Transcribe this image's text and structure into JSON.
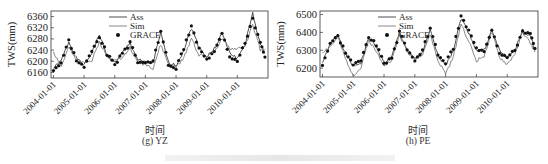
{
  "chart_data": [
    {
      "type": "line",
      "panel_caption": "(g) YZ",
      "xlabel": "时间",
      "ylabel": "TWS(mm)",
      "yticks": [
        6160,
        6200,
        6240,
        6280,
        6320,
        6360
      ],
      "ylim": [
        6140,
        6380
      ],
      "xticks": [
        "2004-01-01",
        "2005-01-01",
        "2006-01-01",
        "2007-01-01",
        "2008-01-01",
        "2009-01-01",
        "2010-01-01"
      ],
      "legend": [
        "Ass",
        "Sim",
        "GRACE"
      ],
      "legend_position": "upper-left-inside",
      "x": [
        2004.0,
        2004.25,
        2004.5,
        2004.75,
        2005.0,
        2005.25,
        2005.5,
        2005.75,
        2006.0,
        2006.25,
        2006.5,
        2006.75,
        2007.0,
        2007.25,
        2007.5,
        2007.75,
        2008.0,
        2008.25,
        2008.5,
        2008.75,
        2009.0,
        2009.25,
        2009.5,
        2009.75,
        2010.0,
        2010.25,
        2010.5,
        2010.75,
        2010.9
      ],
      "series": [
        {
          "name": "Ass",
          "values": [
            6175,
            6200,
            6270,
            6210,
            6185,
            6230,
            6295,
            6220,
            6195,
            6230,
            6265,
            6205,
            6195,
            6195,
            6300,
            6195,
            6185,
            6240,
            6320,
            6250,
            6215,
            6245,
            6300,
            6230,
            6210,
            6260,
            6370,
            6260,
            6230
          ]
        },
        {
          "name": "Sim",
          "values": [
            6235,
            6180,
            6250,
            6200,
            6200,
            6200,
            6270,
            6215,
            6210,
            6210,
            6250,
            6195,
            6190,
            6175,
            6260,
            6190,
            6180,
            6210,
            6285,
            6220,
            6220,
            6235,
            6280,
            6245,
            6245,
            6255,
            6330,
            6240,
            6240
          ]
        },
        {
          "name": "GRACE",
          "values": [
            6170,
            6195,
            6275,
            6205,
            6180,
            6235,
            6290,
            6225,
            6190,
            6225,
            6265,
            6200,
            6195,
            6200,
            6305,
            6190,
            6175,
            6245,
            6325,
            6245,
            6205,
            6240,
            6305,
            6220,
            6200,
            6265,
            6355,
            6265,
            6215
          ]
        }
      ]
    },
    {
      "type": "line",
      "panel_caption": "(h) PE",
      "xlabel": "时间",
      "ylabel": "TWS(mm)",
      "yticks": [
        6200,
        6300,
        6400,
        6500
      ],
      "ylim": [
        6150,
        6520
      ],
      "xticks": [
        "2004-01-01",
        "2005-01-01",
        "2006-01-01",
        "2007-01-01",
        "2008-01-01",
        "2009-01-01",
        "2010-01-01"
      ],
      "legend": [
        "Ass",
        "Sim",
        "GRACE"
      ],
      "legend_position": "upper-left-inside",
      "x": [
        2004.0,
        2004.25,
        2004.5,
        2004.75,
        2005.0,
        2005.25,
        2005.5,
        2005.75,
        2006.0,
        2006.25,
        2006.5,
        2006.75,
        2007.0,
        2007.25,
        2007.5,
        2007.75,
        2008.0,
        2008.25,
        2008.5,
        2008.75,
        2009.0,
        2009.25,
        2009.5,
        2009.75,
        2010.0,
        2010.25,
        2010.5,
        2010.75,
        2010.9
      ],
      "series": [
        {
          "name": "Ass",
          "values": [
            6230,
            6330,
            6390,
            6280,
            6210,
            6230,
            6370,
            6320,
            6230,
            6260,
            6400,
            6300,
            6250,
            6290,
            6410,
            6270,
            6220,
            6300,
            6480,
            6400,
            6300,
            6300,
            6410,
            6300,
            6260,
            6300,
            6410,
            6380,
            6300
          ]
        },
        {
          "name": "Sim",
          "values": [
            6290,
            6320,
            6370,
            6250,
            6160,
            6200,
            6360,
            6290,
            6220,
            6240,
            6390,
            6290,
            6250,
            6280,
            6390,
            6240,
            6170,
            6260,
            6450,
            6350,
            6240,
            6270,
            6400,
            6260,
            6220,
            6280,
            6400,
            6340,
            6290
          ]
        },
        {
          "name": "GRACE",
          "values": [
            6220,
            6340,
            6380,
            6290,
            6220,
            6240,
            6380,
            6330,
            6230,
            6250,
            6400,
            6310,
            6240,
            6300,
            6420,
            6280,
            6230,
            6310,
            6490,
            6410,
            6310,
            6300,
            6420,
            6290,
            6260,
            6300,
            6410,
            6390,
            6310
          ]
        }
      ]
    }
  ],
  "panels": {
    "left": {
      "caption": "(g) YZ",
      "xlabel": "时间",
      "ylabel": "TWS(mm)",
      "yticks": [
        "6160",
        "6200",
        "6240",
        "6280",
        "6320",
        "6360"
      ],
      "legend": {
        "ass": "Ass",
        "sim": "Sim",
        "grace": "GRACE"
      },
      "xticks": [
        "2004-01-01",
        "2005-01-01",
        "2006-01-01",
        "2007-01-01",
        "2008-01-01",
        "2009-01-01",
        "2010-01-01"
      ]
    },
    "right": {
      "caption": "(h) PE",
      "xlabel": "时间",
      "ylabel": "TWS(mm)",
      "yticks": [
        "6200",
        "6300",
        "6400",
        "6500"
      ],
      "legend": {
        "ass": "Ass",
        "sim": "Sim",
        "grace": "GRACE"
      },
      "xticks": [
        "2004-01-01",
        "2005-01-01",
        "2006-01-01",
        "2007-01-01",
        "2008-01-01",
        "2009-01-01",
        "2010-01-01"
      ]
    }
  },
  "colors": {
    "ass": "#3a3a3a",
    "sim": "#7a7a7a",
    "grace": "#111111",
    "axis": "#333333"
  }
}
